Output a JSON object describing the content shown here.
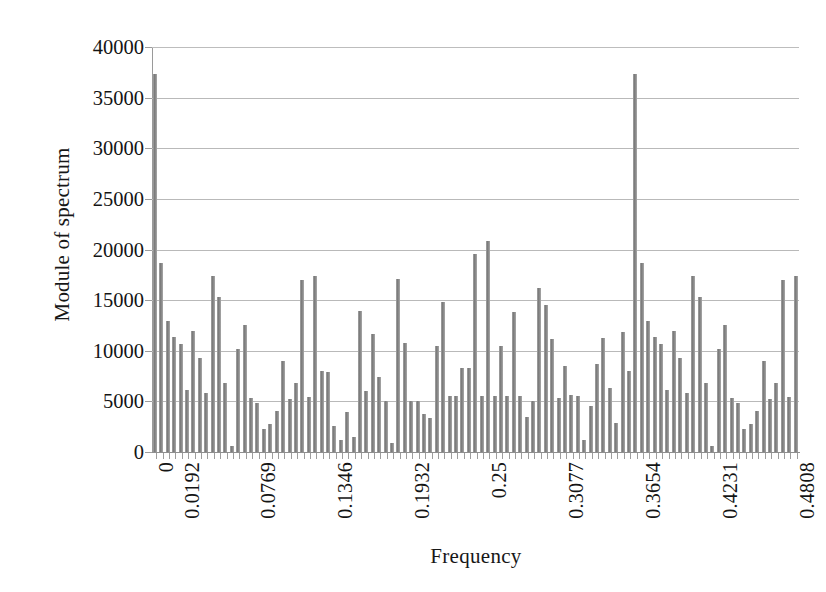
{
  "chart_data": {
    "type": "bar",
    "title": "",
    "xlabel": "Frequency",
    "ylabel": "Module of spectrum",
    "ylim": [
      0,
      40000
    ],
    "ytick_labels": [
      "0",
      "5000",
      "10000",
      "15000",
      "20000",
      "25000",
      "30000",
      "35000",
      "40000"
    ],
    "ytick_values": [
      0,
      5000,
      10000,
      15000,
      20000,
      25000,
      30000,
      35000,
      40000
    ],
    "grid": true,
    "grid_axis": "y",
    "legend": false,
    "bar_color": "#8c8c8c",
    "xtick_labels": [
      "0",
      "0.0192",
      "0.0769",
      "0.1346",
      "0.1932",
      "0.25",
      "0.3077",
      "0.3654",
      "0.4231",
      "0.4808"
    ],
    "xtick_values": [
      0,
      0.0192,
      0.0769,
      0.1346,
      0.1932,
      0.25,
      0.3077,
      0.3654,
      0.4231,
      0.4808
    ],
    "xtick_bar_index": [
      0,
      2,
      8,
      14,
      20,
      26,
      32,
      38,
      44,
      50
    ],
    "x_step": 0.00962,
    "n_bars": 101,
    "values": [
      37300,
      18700,
      12900,
      11400,
      10700,
      6100,
      12000,
      9300,
      5800,
      17400,
      15300,
      6800,
      600,
      10200,
      12500,
      5300,
      4800,
      2300,
      2800,
      4100,
      9000,
      5200,
      6800,
      17000,
      5400,
      17400,
      8000,
      7900,
      2600,
      1200,
      4000,
      1500,
      13900,
      6000,
      11700,
      7400,
      5000,
      900,
      17100,
      10800,
      5000,
      5000,
      3800,
      3400,
      10500,
      14800,
      5500,
      5500,
      8300,
      8300,
      19600,
      5500,
      20800,
      5500,
      10500,
      5500,
      13800,
      5500,
      3500,
      5000,
      16200,
      14500,
      11200,
      5300,
      8500,
      5600,
      5500,
      1200,
      4500,
      8700,
      11300,
      6300,
      2900,
      11900,
      8000
    ],
    "values_note": "Module of spectrum magnitudes read off the y-axis for each frequency bin"
  },
  "axes": {
    "y_title": "Module of spectrum",
    "x_title": "Frequency"
  }
}
